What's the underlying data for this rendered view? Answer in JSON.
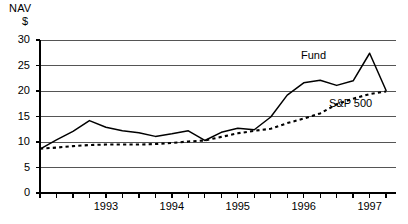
{
  "chart_data": {
    "type": "line",
    "title": "",
    "ylabel": "NAV $",
    "ylabel_lines": [
      "NAV",
      "$"
    ],
    "xlabel": "",
    "ylim": [
      0,
      30
    ],
    "yticks": [
      0,
      5,
      10,
      15,
      20,
      25,
      30
    ],
    "ytick_labels": [
      "0",
      "5",
      "10",
      "15",
      "20",
      "25",
      "30"
    ],
    "grid": true,
    "grid_axis": "y",
    "xtick_labels": [
      "1993",
      "1994",
      "1995",
      "1996",
      "1997"
    ],
    "x_minor_ticks_per_year": 4,
    "xlim_years": [
      1992.5,
      1997.9
    ],
    "legend_position": "inline-annotations",
    "x": [
      1992.5,
      1992.75,
      1993.0,
      1993.25,
      1993.5,
      1993.75,
      1994.0,
      1994.25,
      1994.5,
      1994.75,
      1995.0,
      1995.25,
      1995.5,
      1995.75,
      1996.0,
      1996.25,
      1996.5,
      1996.75,
      1997.0,
      1997.25,
      1997.5,
      1997.75
    ],
    "series": [
      {
        "name": "Fund",
        "style": "solid",
        "color": "#000000",
        "values": [
          8.6,
          10.4,
          12.1,
          14.2,
          12.9,
          12.2,
          11.8,
          11.1,
          11.6,
          12.2,
          10.3,
          11.9,
          12.7,
          12.4,
          14.9,
          19.2,
          21.6,
          22.1,
          21.1,
          22.0,
          27.4,
          20.1
        ]
      },
      {
        "name": "S&P 500",
        "style": "dotted",
        "color": "#000000",
        "values": [
          8.7,
          8.9,
          9.2,
          9.4,
          9.5,
          9.5,
          9.5,
          9.6,
          9.8,
          10.1,
          10.3,
          11.0,
          11.7,
          12.2,
          12.6,
          13.7,
          14.6,
          15.6,
          17.4,
          18.5,
          19.4,
          19.9
        ]
      }
    ],
    "annotations": [
      {
        "text": "Fund",
        "series": "Fund"
      },
      {
        "text": "S&P 500",
        "series": "S&P 500"
      }
    ]
  },
  "axis": {
    "nav": "NAV",
    "dollar": "$"
  }
}
